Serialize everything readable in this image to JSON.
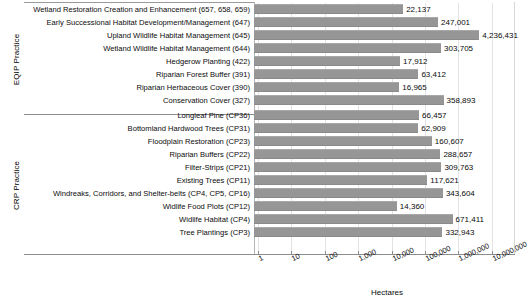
{
  "chart_data": {
    "type": "bar",
    "orientation": "horizontal",
    "title": "",
    "xlabel": "Hectares",
    "ylabel": "",
    "xscale": "log",
    "xlim": [
      1,
      10000000
    ],
    "xticks": [
      "1",
      "10",
      "100",
      "1,000",
      "10,000",
      "100,000",
      "1,000,000",
      "10,000,000"
    ],
    "xtick_values": [
      1,
      10,
      100,
      1000,
      10000,
      100000,
      1000000,
      10000000
    ],
    "grid": true,
    "legend": "none",
    "bar_color": "#969696",
    "groups": [
      {
        "name": "EQIP Practice",
        "categories": [
          "Wetland Restoration Creation and Enhancement (657, 658, 659)",
          "Early Successional Habitat Development/Management (647)",
          "Upland Wildlife Habitat Management (645)",
          "Wetland Wildlife Habitat Management (644)",
          "Hedgerow Planting (422)",
          "Riparian Forest Buffer (391)",
          "Riparian Herbaceous Cover (390)",
          "Conservation Cover (327)"
        ],
        "values": [
          22137,
          247001,
          4236431,
          303705,
          17912,
          63412,
          16965,
          358893
        ],
        "value_labels": [
          "22,137",
          "247,001",
          "4,236,431",
          "303,705",
          "17,912",
          "63,412",
          "16,965",
          "358,893"
        ]
      },
      {
        "name": "CRP Practice",
        "categories": [
          "Longleaf Pine (CP36)",
          "Bottomland Hardwood Trees (CP31)",
          "Floodplain Restoration (CP23)",
          "Riparian Buffers (CP22)",
          "Filter-Strips (CP21)",
          "Existing Trees (CP11)",
          "Windreaks, Corridors, and Shelter-belts (CP4, CP5, CP16)",
          "Widlife Food Plots (CP12)",
          "Widlife Habitat (CP4)",
          "Tree Plantings (CP3)"
        ],
        "values": [
          66457,
          62909,
          160607,
          288657,
          309763,
          117621,
          343604,
          14360,
          671411,
          332943
        ],
        "value_labels": [
          "66,457",
          "62,909",
          "160,607",
          "288,657",
          "309,763",
          "117,621",
          "343,604",
          "14,360",
          "671,411",
          "332,943"
        ]
      }
    ]
  },
  "axis": {
    "group_eqip_label": "EQIP Practice",
    "group_crp_label": "CRP Practice",
    "x_axis_title": "Hectares"
  }
}
